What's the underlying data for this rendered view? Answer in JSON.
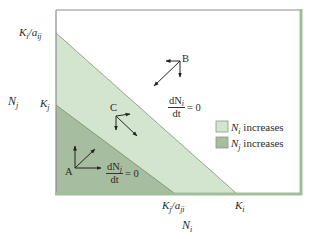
{
  "diagram": {
    "type": "lotka-volterra-competition-isoclines",
    "colors": {
      "background": "#ffffff",
      "frame_top_left": "#8c8c8c",
      "frame_bottom_right": "#9fbf98",
      "region_Ni_increases": "#d3e5cf",
      "region_Nj_increases": "#a6bd9f",
      "isocline_Ni": "#8ea889",
      "isocline_Nj": "#7f9b79",
      "arrow": "#222222"
    },
    "axes": {
      "x_label_base": "N",
      "x_label_sub": "i",
      "y_label_base": "N",
      "y_label_sub": "j"
    },
    "y_ticks": [
      {
        "base": "K",
        "sub1": "i",
        "mid": "/a",
        "sub2": "ij"
      },
      {
        "base": "K",
        "sub1": "j",
        "mid": "",
        "sub2": ""
      }
    ],
    "x_ticks": [
      {
        "base": "K",
        "sub1": "j",
        "mid": "/a",
        "sub2": "ji"
      },
      {
        "base": "K",
        "sub1": "i",
        "mid": "",
        "sub2": ""
      }
    ],
    "isoclines": [
      {
        "name": "Ni isocline",
        "num_d": "dN",
        "num_sub": "i",
        "den": "dt",
        "eq": "= 0",
        "y_intercept": "Ki/aij",
        "x_intercept": "Ki"
      },
      {
        "name": "Nj isocline",
        "num_d": "dN",
        "num_sub": "j",
        "den": "dt",
        "eq": "= 0",
        "y_intercept": "Kj",
        "x_intercept": "Kj/aji"
      }
    ],
    "points": [
      {
        "label": "A",
        "arrows": [
          "up",
          "right",
          "up-right"
        ]
      },
      {
        "label": "B",
        "arrows": [
          "left",
          "down",
          "down-left"
        ]
      },
      {
        "label": "C",
        "arrows": [
          "right",
          "down",
          "down-right"
        ]
      }
    ],
    "legend": [
      {
        "base": "N",
        "sub": "i",
        "text": " increases",
        "color": "#d3e5cf"
      },
      {
        "base": "N",
        "sub": "j",
        "text": " increases",
        "color": "#a6bd9f"
      }
    ]
  }
}
